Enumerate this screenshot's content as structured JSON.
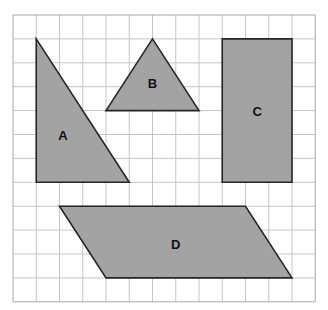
{
  "grid": {
    "origin_x": 13,
    "origin_y": 15,
    "cell_w": 23.25,
    "cell_h": 23.9,
    "cols": 13,
    "rows": 12,
    "line_color": "#c6c6c6",
    "border_color": "#a8a8a8"
  },
  "style": {
    "fill": "#a3a3a3",
    "stroke": "#262626"
  },
  "shapes": [
    {
      "id": "A",
      "label": "A",
      "type": "right-triangle",
      "points": [
        [
          1,
          1
        ],
        [
          1,
          7
        ],
        [
          5,
          7
        ]
      ],
      "label_pos": [
        2.15,
        5.1
      ]
    },
    {
      "id": "B",
      "label": "B",
      "type": "isosceles-triangle",
      "points": [
        [
          6,
          1
        ],
        [
          4,
          4
        ],
        [
          8,
          4
        ]
      ],
      "label_pos": [
        6,
        2.9
      ]
    },
    {
      "id": "C",
      "label": "C",
      "type": "rectangle",
      "points": [
        [
          9,
          1
        ],
        [
          12,
          1
        ],
        [
          12,
          7
        ],
        [
          9,
          7
        ]
      ],
      "label_pos": [
        10.5,
        4.1
      ]
    },
    {
      "id": "D",
      "label": "D",
      "type": "parallelogram",
      "points": [
        [
          2,
          8
        ],
        [
          10,
          8
        ],
        [
          12,
          11
        ],
        [
          4,
          11
        ]
      ],
      "label_pos": [
        7,
        9.65
      ]
    }
  ]
}
